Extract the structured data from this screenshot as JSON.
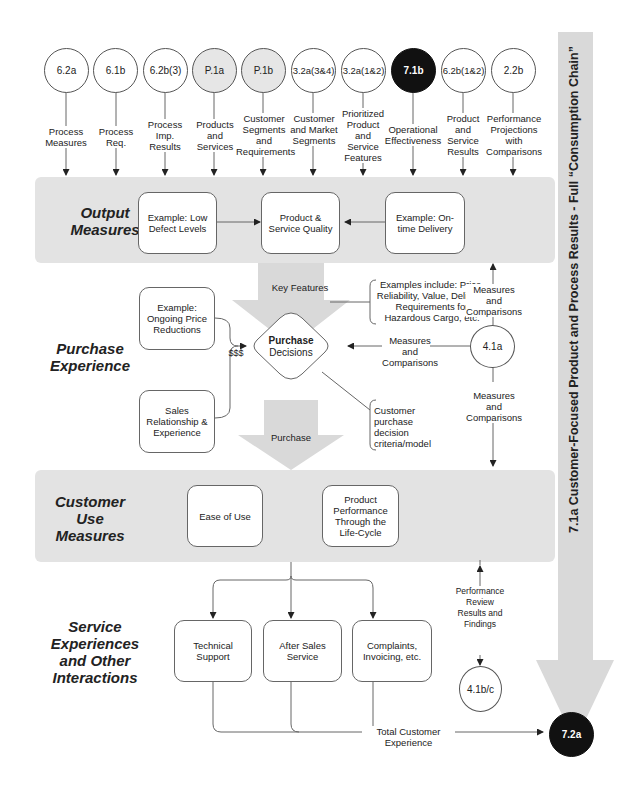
{
  "title": "7.1a  Customer-Focused Product and Process Results - Full “Consumption Chain”",
  "top_nodes": [
    {
      "id": "6.2a",
      "style": "white",
      "label": "Process Measures"
    },
    {
      "id": "6.1b",
      "style": "white",
      "label": "Process Req."
    },
    {
      "id": "6.2b(3)",
      "style": "white",
      "label": "Process Imp. Results"
    },
    {
      "id": "P.1a",
      "style": "gray",
      "label": "Products and Services"
    },
    {
      "id": "P.1b",
      "style": "gray",
      "label": "Customer Segments and Requirements"
    },
    {
      "id": "3.2a(3&4)",
      "style": "white",
      "label": "Customer and Market Segments"
    },
    {
      "id": "3.2a(1&2)",
      "style": "white",
      "label": "Prioritized Product and Service Features"
    },
    {
      "id": "7.1b",
      "style": "black",
      "label": "Operational Effectiveness"
    },
    {
      "id": "6.2b(1&2)",
      "style": "white",
      "label": "Product and Service Results"
    },
    {
      "id": "2.2b",
      "style": "white",
      "label": "Performance Projections with Comparisons"
    }
  ],
  "sections": {
    "output": {
      "title": "Output Measures",
      "boxes": [
        "Example: Low Defect Levels",
        "Product & Service Quality",
        "Example: On-time Delivery"
      ]
    },
    "purchase": {
      "title": "Purchase Experience",
      "key_features": "Key Features",
      "examples_note": "Examples include: Price, Reliability, Value, Delivery, Requirements for Hazardous Cargo, etc.",
      "price_box": "Example: Ongoing Price Reductions",
      "sales_box": "Sales Relationship & Experience",
      "money": "$$$",
      "decision_bold": "Purchase",
      "decision_rest": "Decisions",
      "purchase_arrow": "Purchase",
      "criteria_note": "Customer purchase decision criteria/model",
      "measures_left": "Measures and Comparisons",
      "node_41a": "4.1a",
      "measures_up": "Measures and Comparisons",
      "measures_down": "Measures and Comparisons"
    },
    "use": {
      "title": "Customer Use Measures",
      "boxes": [
        "Ease of Use",
        "Product Performance Through the Life-Cycle"
      ]
    },
    "service": {
      "title": "Service Experiences and Other Interactions",
      "boxes": [
        "Technical Support",
        "After Sales Service",
        "Complaints, Invoicing, etc."
      ],
      "review": "Performance Review Results and Findings",
      "node_41bc": "4.1b/c",
      "total": "Total Customer Experience",
      "node_72a": "7.2a"
    }
  },
  "colors": {
    "band": "#e3e3e3",
    "arrow_gray": "#d9d9d9",
    "black_node": "#111111",
    "gray_node": "#e6e6e6"
  }
}
